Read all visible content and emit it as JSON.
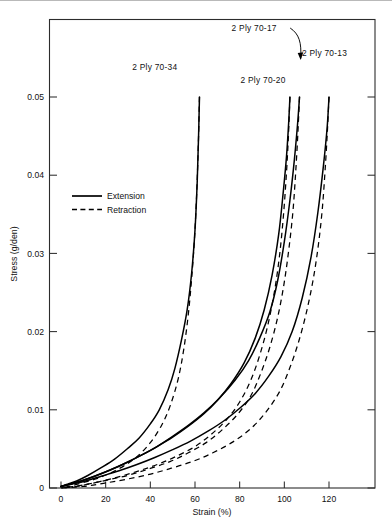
{
  "chart_data": {
    "type": "line",
    "title": "",
    "xlabel": "Strain  (%)",
    "ylabel": "Stress (g/den)",
    "xlim": [
      0,
      134
    ],
    "ylim": [
      0,
      0.0601
    ],
    "xticks": [
      0,
      20,
      40,
      60,
      80,
      100,
      120
    ],
    "xticklabels": [
      "0",
      "20",
      "40",
      "60",
      "80",
      "100",
      "120"
    ],
    "yticks": [
      0,
      0.01,
      0.02,
      0.03,
      0.04,
      0.05
    ],
    "yticklabels": [
      "0",
      "0.01",
      "0.02",
      "0.03",
      "0.04",
      "0.05"
    ],
    "grid": false,
    "legend_position": "upper-left-inside",
    "legend": [
      {
        "name": "Extension",
        "style": "solid"
      },
      {
        "name": "Retraction",
        "style": "dashed"
      }
    ],
    "annotations": [
      {
        "text": "2 Ply 70-34",
        "x": 42.0,
        "y": 0.0535,
        "leader": false
      },
      {
        "text": "2 Ply 70-17",
        "x": 86.5,
        "y": 0.0585,
        "leader": true
      },
      {
        "text": "2 Ply 70-20",
        "x": 90.5,
        "y": 0.0518,
        "leader": false
      },
      {
        "text": "2 Ply 70-13",
        "x": 118.0,
        "y": 0.0552,
        "leader": false
      }
    ],
    "series": [
      {
        "name": "2 Ply 70-34 Extension",
        "specimen": "2 Ply 70-34",
        "style": "solid",
        "x": [
          0,
          3,
          7,
          12,
          18,
          24,
          30,
          35,
          40,
          44,
          48,
          51,
          54,
          56.5,
          58.5,
          60,
          61,
          61.6,
          62
        ],
        "y": [
          0.0002,
          0.0005,
          0.0009,
          0.0016,
          0.0026,
          0.0037,
          0.0051,
          0.0064,
          0.0082,
          0.01,
          0.0126,
          0.0153,
          0.019,
          0.0228,
          0.0275,
          0.033,
          0.0392,
          0.045,
          0.05
        ]
      },
      {
        "name": "2 Ply 70-34 Retraction",
        "specimen": "2 Ply 70-34",
        "style": "dashed",
        "x": [
          62,
          61.5,
          60.8,
          59.8,
          58.5,
          57,
          55,
          52.5,
          49,
          45,
          40,
          34,
          28,
          22,
          16,
          10,
          5,
          0
        ],
        "y": [
          0.05,
          0.044,
          0.038,
          0.032,
          0.0268,
          0.0222,
          0.0178,
          0.014,
          0.0106,
          0.008,
          0.0058,
          0.004,
          0.0028,
          0.0019,
          0.0012,
          0.0007,
          0.0003,
          0.0
        ]
      },
      {
        "name": "2 Ply 70-20 Extension",
        "specimen": "2 Ply 70-20",
        "style": "solid",
        "x": [
          0,
          4,
          9,
          15,
          22,
          29,
          36,
          43,
          50,
          57,
          64,
          70,
          76,
          82,
          87,
          91,
          94.5,
          97.5,
          99.5,
          101,
          102,
          102.5
        ],
        "y": [
          0.0002,
          0.0005,
          0.0009,
          0.0015,
          0.0023,
          0.0032,
          0.0042,
          0.0053,
          0.0065,
          0.0079,
          0.0095,
          0.0112,
          0.0133,
          0.016,
          0.0192,
          0.0228,
          0.0272,
          0.0325,
          0.0378,
          0.0425,
          0.047,
          0.05
        ]
      },
      {
        "name": "2 Ply 70-20 Retraction",
        "specimen": "2 Ply 70-20",
        "style": "dashed",
        "x": [
          102.5,
          101.8,
          100.8,
          99.5,
          97.8,
          95.5,
          92.5,
          89,
          85,
          80,
          74,
          67,
          60,
          52,
          44,
          36,
          28,
          20,
          12,
          6,
          0
        ],
        "y": [
          0.05,
          0.0448,
          0.0396,
          0.0345,
          0.0296,
          0.025,
          0.0207,
          0.017,
          0.0138,
          0.011,
          0.0087,
          0.0068,
          0.0053,
          0.0041,
          0.0031,
          0.0023,
          0.0016,
          0.001,
          0.0005,
          0.0002,
          0.0
        ]
      },
      {
        "name": "2 Ply 70-17 Extension",
        "specimen": "2 Ply 70-17",
        "style": "solid",
        "x": [
          0,
          4,
          9,
          15,
          22,
          29,
          36,
          43,
          50,
          57,
          64,
          71,
          78,
          84,
          89,
          93.5,
          97,
          100,
          102.5,
          104.5,
          106,
          106.8
        ],
        "y": [
          0.0002,
          0.0005,
          0.0009,
          0.0015,
          0.0023,
          0.0032,
          0.0042,
          0.0053,
          0.0066,
          0.008,
          0.0096,
          0.0115,
          0.0138,
          0.0163,
          0.0192,
          0.0225,
          0.0265,
          0.0315,
          0.0368,
          0.042,
          0.0468,
          0.05
        ]
      },
      {
        "name": "2 Ply 70-17 Retraction",
        "specimen": "2 Ply 70-17",
        "style": "dashed",
        "x": [
          106.8,
          106,
          105,
          103.8,
          102,
          99.8,
          97,
          93.5,
          89.5,
          85,
          79,
          72,
          65,
          57,
          49,
          40,
          31,
          22,
          14,
          7,
          0
        ],
        "y": [
          0.05,
          0.045,
          0.04,
          0.0352,
          0.0305,
          0.026,
          0.0218,
          0.018,
          0.0147,
          0.0118,
          0.0094,
          0.0074,
          0.0058,
          0.0045,
          0.0034,
          0.0025,
          0.0017,
          0.0011,
          0.0006,
          0.0002,
          0.0
        ]
      },
      {
        "name": "2 Ply 70-13 Extension",
        "specimen": "2 Ply 70-13",
        "style": "solid",
        "x": [
          0,
          5,
          11,
          18,
          26,
          34,
          42,
          50,
          58,
          66,
          73,
          80,
          87,
          93,
          98.5,
          103.5,
          108,
          112,
          115,
          117.5,
          119.2,
          120
        ],
        "y": [
          0.0002,
          0.0005,
          0.0009,
          0.0015,
          0.0022,
          0.003,
          0.0039,
          0.0049,
          0.006,
          0.0073,
          0.0086,
          0.0102,
          0.0121,
          0.0143,
          0.0168,
          0.02,
          0.0243,
          0.0296,
          0.0352,
          0.0412,
          0.0462,
          0.05
        ]
      },
      {
        "name": "2 Ply 70-13 Retraction",
        "specimen": "2 Ply 70-13",
        "style": "dashed",
        "x": [
          120,
          119.2,
          118.2,
          117,
          115.3,
          113,
          110,
          106.5,
          102.5,
          98,
          92,
          85,
          77,
          68,
          59,
          49,
          39,
          29,
          19,
          10,
          0
        ],
        "y": [
          0.05,
          0.0452,
          0.0404,
          0.0357,
          0.0312,
          0.0268,
          0.0226,
          0.0188,
          0.0154,
          0.0124,
          0.0098,
          0.0076,
          0.0059,
          0.0045,
          0.0034,
          0.0025,
          0.0017,
          0.0011,
          0.0006,
          0.0002,
          0.0
        ]
      }
    ]
  }
}
